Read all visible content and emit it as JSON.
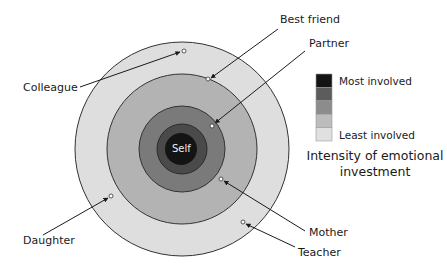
{
  "diagram": {
    "title": "Intensity of emotional investment",
    "center": {
      "x": 182,
      "y": 149
    },
    "rings": [
      {
        "level": 5,
        "radius": 107,
        "color": "#dedede"
      },
      {
        "level": 4,
        "radius": 75,
        "color": "#b3b3b3"
      },
      {
        "level": 3,
        "radius": 43,
        "color": "#7a7a7a"
      },
      {
        "level": 2,
        "radius": 25,
        "color": "#4a4a4a"
      },
      {
        "level": 1,
        "radius": 16,
        "color": "#141414"
      }
    ],
    "self_label": "Self",
    "people": [
      {
        "name": "Colleague",
        "ring": "outer"
      },
      {
        "name": "Best friend",
        "ring": "outer"
      },
      {
        "name": "Partner",
        "ring": "inner"
      },
      {
        "name": "Mother",
        "ring": "middle"
      },
      {
        "name": "Teacher",
        "ring": "outer"
      },
      {
        "name": "Daughter",
        "ring": "outer"
      }
    ]
  },
  "legend": {
    "most_label": "Most involved",
    "least_label": "Least involved",
    "caption_line1": "Intensity of emotional",
    "caption_line2": "investment",
    "swatches": [
      "#141414",
      "#5c5c5c",
      "#8c8c8c",
      "#bcbcbc",
      "#e0e0e0"
    ]
  }
}
